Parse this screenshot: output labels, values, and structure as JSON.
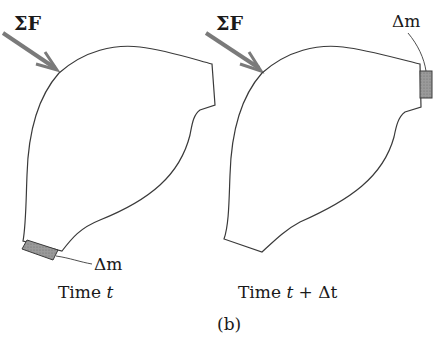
{
  "figure": {
    "caption": "(b)",
    "colors": {
      "outline": "#3a3a3a",
      "force_arrow": "#7a7a7a",
      "mass_element_fill": "#8f8f8f",
      "text": "#1a1a1a",
      "background": "#ffffff"
    },
    "panels": [
      {
        "name": "time-t",
        "force_label": "ΣF",
        "mass_label": "Δm",
        "time_label_prefix": "Time ",
        "time_label_var": "t",
        "time_label_suffix": ""
      },
      {
        "name": "time-t-plus-dt",
        "force_label": "ΣF",
        "mass_label": "Δm",
        "time_label_prefix": "Time ",
        "time_label_var": "t",
        "time_label_suffix": " + Δt"
      }
    ]
  }
}
